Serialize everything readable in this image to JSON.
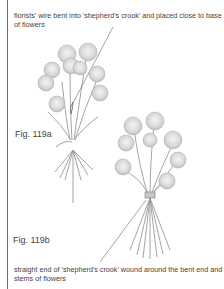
{
  "captions": {
    "top": "florists' wire bent into 'shepherd's crook' and placed close to base of flowers",
    "bottom": "straight end of 'shepherd's crook' wound around the bent end and stems of flowers"
  },
  "figures": {
    "a": {
      "label": "Fig. 119a"
    },
    "b": {
      "label": "Fig. 119b"
    }
  }
}
